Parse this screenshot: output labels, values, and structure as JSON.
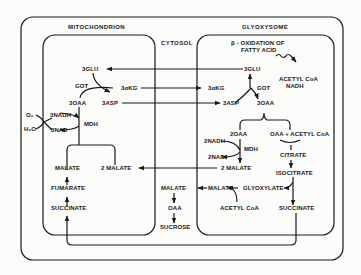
{
  "compartments": {
    "mitochondrion": "MITOCHONDRION",
    "cytosol": "CYTOSOL",
    "glyoxysome": "GLYOXYSOME"
  },
  "mitochondrion": {
    "glu": "3GLU",
    "got": "GOT",
    "akg": "3αKG",
    "oaa": "3OAA",
    "asp": "3ASP",
    "o2": "O₂",
    "h2o": "H₂O",
    "nadh": "3NADH",
    "nad": "3NAD",
    "mdh": "MDH",
    "malate": "MALATE",
    "two_malate": "2 MALATE",
    "fumarate": "FUMARATE",
    "succinate": "SUCCINATE"
  },
  "cytosol": {
    "malate": "MALATE",
    "oaa": "OAA",
    "sucrose": "SUCROSE"
  },
  "glyoxysome": {
    "beta_ox_line1": "β - OXIDATION OF",
    "beta_ox_line2": "FATTY ACID",
    "acetyl_coa_top": "ACETYL CoA",
    "nadh_top": "NADH",
    "glu": "3GLU",
    "akg": "3αKG",
    "got": "GOT",
    "asp": "3ASP",
    "oaa": "3OAA",
    "two_oaa": "2OAA",
    "oaa_acetyl": "OAA + ACETYL CoA",
    "two_nadh": "2NADH",
    "two_nad": "2NAD",
    "mdh": "MDH",
    "two_malate": "2 MALATE",
    "citrate": "CITRATE",
    "isocitrate": "ISOCITRATE",
    "malate": "MALATE",
    "glyoxylate": "GLYOXYLATE",
    "acetyl_coa_bottom": "ACETYL CoA",
    "succinate": "SUCCINATE"
  }
}
